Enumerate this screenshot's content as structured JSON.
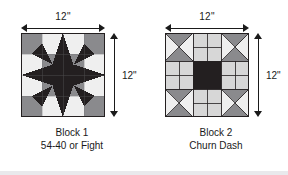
{
  "figure": {
    "background_color": "#ffffff",
    "ink_color": "#1a1a1a"
  },
  "palette": {
    "dark": "#231f20",
    "medium_gray": "#8a8a8d",
    "light_gray": "#d7d7d7",
    "very_light": "#efefef",
    "outline": "#231f20"
  },
  "blocks": [
    {
      "id": "block-1",
      "caption_line1": "Block 1",
      "caption_line2": "54-40 or Fight",
      "width_label": "12\"",
      "height_label": "12\"",
      "pattern": "54-40 or Fight star",
      "grid": "4x4 with eight-point star overlay"
    },
    {
      "id": "block-2",
      "caption_line1": "Block 2",
      "caption_line2": "Churn Dash",
      "width_label": "12\"",
      "height_label": "12\"",
      "pattern": "Churn Dash",
      "grid": "3x3 with hourglass corners, rail sides, solid center"
    }
  ]
}
